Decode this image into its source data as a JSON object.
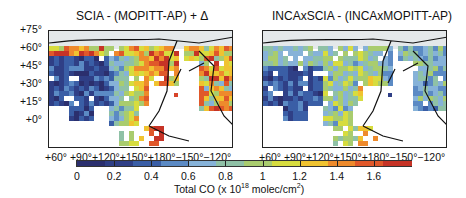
{
  "panels": [
    {
      "title": "SCIA - (MOPITT-AP) + Δ",
      "left": 48,
      "variant": "scia"
    },
    {
      "title": "INCAxSCIA - (INCAxMOPITT-AP)",
      "left": 262,
      "variant": "inca"
    }
  ],
  "y_tick_labels": [
    "+75°",
    "+60°",
    "+45°",
    "+30°",
    "+15°",
    "+0°"
  ],
  "x_tick_labels": "+60°  +90°+120°+150°+180°−150°−120°",
  "colorbar": {
    "ticks": [
      "0",
      "0.2",
      "0.4",
      "0.6",
      "0.8",
      "1",
      "1.2",
      "1.4",
      "1.6"
    ],
    "min": 0,
    "max": 1.8,
    "label_prefix": "Total CO (x 10",
    "label_exp": "18",
    "label_mid": " molec/cm",
    "label_exp2": "2",
    "label_suffix": ")",
    "colors": [
      "#2b2f6e",
      "#2f3f86",
      "#3a5ea6",
      "#5b8ac4",
      "#86b2d8",
      "#8fc1a6",
      "#a9cc6e",
      "#d7dc3e",
      "#f0c330",
      "#ee8a2c",
      "#e0582a",
      "#c63326"
    ]
  },
  "chart_data": [
    {
      "type": "heatmap",
      "title": "SCIA - (MOPITT-AP) + Δ",
      "xlabel": "Longitude",
      "ylabel": "Latitude",
      "x_ticks": [
        "+60°",
        "+90°",
        "+120°",
        "+150°",
        "+180°",
        "−150°",
        "−120°"
      ],
      "y_ticks": [
        "+75°",
        "+60°",
        "+45°",
        "+30°",
        "+15°",
        "+0°"
      ],
      "colorbar_range": [
        0,
        1.8
      ],
      "colorbar_label": "Total CO (x 10^18 molec/cm^2)",
      "description": "Low values (0-0.4) over Tibet/Central Asia, high (1.2-1.8) over East China, Korea, Japan and Siberian fire regions; moderate over Alaska/W. North America"
    },
    {
      "type": "heatmap",
      "title": "INCAxSCIA - (INCAxMOPITT-AP)",
      "xlabel": "Longitude",
      "ylabel": "Latitude",
      "x_ticks": [
        "+60°",
        "+90°",
        "+120°",
        "+150°",
        "+180°",
        "−150°",
        "−120°"
      ],
      "y_ticks": [
        "+75°",
        "+60°",
        "+45°",
        "+30°",
        "+15°",
        "+0°"
      ],
      "colorbar_range": [
        0,
        1.8
      ],
      "colorbar_label": "Total CO (x 10^18 molec/cm^2)",
      "description": "Smoother field: mostly 0.6-1.1 across mid-latitudes, peaks ~1.2-1.4 over East China; low over Tibet and tropics"
    }
  ]
}
